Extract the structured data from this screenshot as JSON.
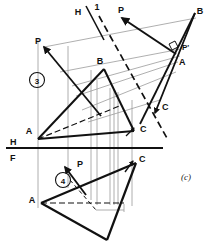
{
  "figure": {
    "caption": "(c)",
    "background_color": "#ffffff",
    "ink_color": "#111111",
    "projection_line_color": "#9a9a9a"
  },
  "fold_lines": {
    "hf": {
      "label_top": "H",
      "label_bottom": "F",
      "note": "horizontal / frontal fold line"
    },
    "h1": {
      "label_left": "H",
      "label_right": "1",
      "note": "horizontal / auxiliary-1 fold line, inclined"
    }
  },
  "view_numbers": [
    {
      "text": "3"
    },
    {
      "text": "4"
    }
  ],
  "labels": {
    "top_fold_h": "H",
    "top_fold_1": "1",
    "p_top_center": "P",
    "b_aux_top_right": "B",
    "p_prime_aux": "P'",
    "a_aux": "A",
    "c_aux": "C",
    "p_upper_left": "P",
    "b_top_view": "B",
    "a_top_view": "A",
    "c_top_view": "C",
    "h_fold": "H",
    "f_fold": "F",
    "c_front_view": "C",
    "p_front_view": "P",
    "a_front_view": "A",
    "figure_caption": "(c)"
  },
  "geometry_notes": {
    "top_view_triangle": "A-B-C horizontal projection",
    "front_view_triangle": "A-C-B frontal projection below H/F",
    "auxiliary_view": "edge view of plane showing true perpendicularity at P'",
    "right_angle_marker": "square symbol at P' indicating 90 degrees"
  }
}
